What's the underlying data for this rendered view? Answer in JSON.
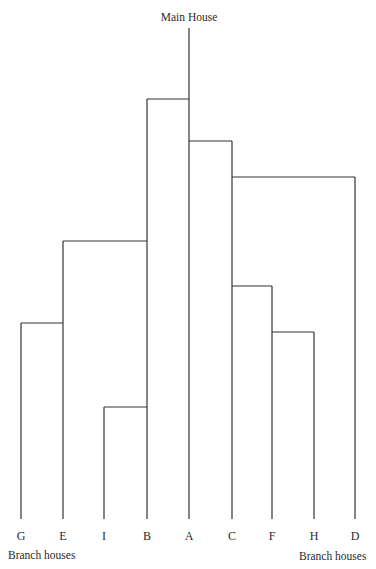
{
  "diagram": {
    "type": "dendrogram",
    "root_label": "Main House",
    "bottom_labels": {
      "left": "Branch houses",
      "right": "Branch houses"
    },
    "leaves": [
      {
        "id": "G",
        "label": "G",
        "x": 21
      },
      {
        "id": "E",
        "label": "E",
        "x": 63
      },
      {
        "id": "I",
        "label": "I",
        "x": 104
      },
      {
        "id": "B",
        "label": "B",
        "x": 147
      },
      {
        "id": "A",
        "label": "A",
        "x": 189
      },
      {
        "id": "C",
        "label": "C",
        "x": 232
      },
      {
        "id": "F",
        "label": "F",
        "x": 272
      },
      {
        "id": "H",
        "label": "H",
        "x": 314
      },
      {
        "id": "D",
        "label": "D",
        "x": 355
      }
    ],
    "root_trunk": {
      "leaf": "A",
      "top_y": 28
    },
    "branches": [
      {
        "parent": "A",
        "child": "B",
        "y": 99
      },
      {
        "parent": "A",
        "child": "C",
        "y": 141
      },
      {
        "parent": "C",
        "child": "D",
        "y": 177
      },
      {
        "parent": "B",
        "child": "E",
        "y": 241
      },
      {
        "parent": "C",
        "child": "F",
        "y": 286
      },
      {
        "parent": "E",
        "child": "G",
        "y": 323
      },
      {
        "parent": "F",
        "child": "H",
        "y": 332
      },
      {
        "parent": "B",
        "child": "I",
        "y": 407
      }
    ],
    "baseline_y": 519,
    "line_color": "#333333"
  }
}
